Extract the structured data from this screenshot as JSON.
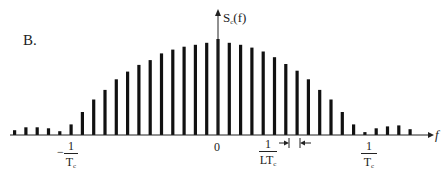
{
  "panel_label": "B.",
  "axis": {
    "y_label_main": "S",
    "y_label_sub": "c",
    "y_label_arg": "(f)",
    "x_label": "f",
    "origin_label": "0"
  },
  "annotations": {
    "neg_tc": {
      "sign": "−",
      "num": "1",
      "den_main": "T",
      "den_sub": "c"
    },
    "pos_tc": {
      "num": "1",
      "den_main": "T",
      "den_sub": "c"
    },
    "spacing": {
      "num": "1",
      "den_main": "LT",
      "den_sub": "c"
    }
  },
  "chart_data": {
    "type": "bar",
    "title": "B.",
    "xlabel": "f",
    "ylabel": "S_c(f)",
    "x_ticks": [
      "-1/Tc",
      "0",
      "1/Tc"
    ],
    "line_spacing_label": "1/(L·Tc)",
    "grid": false,
    "legend": null,
    "categories": [
      -18,
      -17,
      -16,
      -15,
      -14,
      -13,
      -12,
      -11,
      -10,
      -9,
      -8,
      -7,
      -6,
      -5,
      -4,
      -3,
      -2,
      -1,
      0,
      1,
      2,
      3,
      4,
      5,
      6,
      7,
      8,
      9,
      10,
      11,
      12,
      13,
      14,
      15,
      16,
      17,
      18
    ],
    "values": [
      0.05,
      0.08,
      0.08,
      0.07,
      0.04,
      0.11,
      0.24,
      0.37,
      0.47,
      0.58,
      0.66,
      0.73,
      0.78,
      0.85,
      0.89,
      0.92,
      0.94,
      0.96,
      1.0,
      0.96,
      0.94,
      0.91,
      0.87,
      0.81,
      0.74,
      0.67,
      0.58,
      0.47,
      0.37,
      0.24,
      0.11,
      0.03,
      0.07,
      0.09,
      0.1,
      0.06,
      0.0
    ],
    "ylim": [
      0,
      1.05
    ]
  }
}
